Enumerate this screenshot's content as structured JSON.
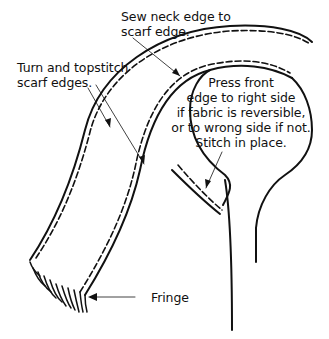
{
  "diagram": {
    "type": "sewing-instruction-illustration",
    "colors": {
      "ink": "#111111",
      "background": "#ffffff"
    },
    "labels": {
      "sew_neck": {
        "lines": [
          "Sew neck edge to",
          "scarf edge."
        ]
      },
      "topstitch": {
        "lines": [
          "Turn and topstitch",
          "scarf edges."
        ]
      },
      "press_front": {
        "lines": [
          "Press front",
          "edge to right side",
          "if fabric is reversible,",
          "or to wrong side if not.",
          "Stitch in place."
        ]
      },
      "fringe": {
        "text": "Fringe"
      }
    }
  }
}
